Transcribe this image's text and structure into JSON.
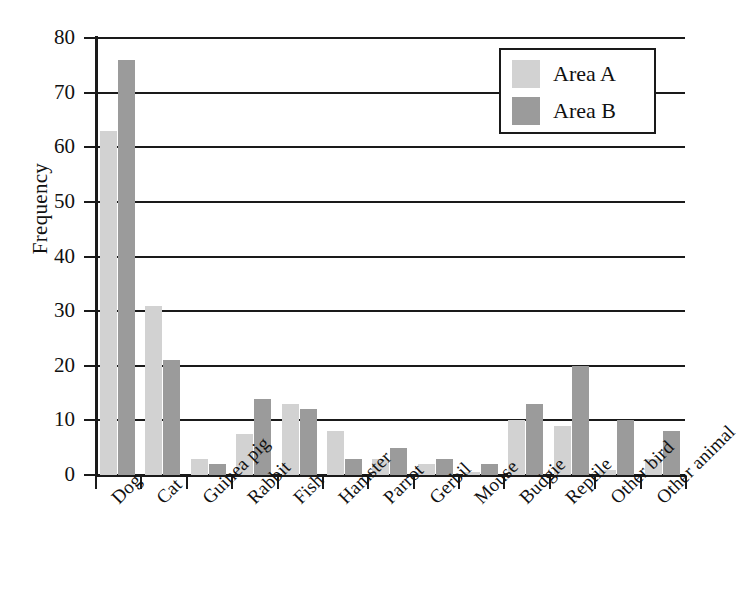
{
  "chart_data": {
    "type": "bar",
    "title": "",
    "xlabel": "",
    "ylabel": "Frequency",
    "ylim": [
      0,
      80
    ],
    "ytick_step": 10,
    "yticks": [
      0,
      10,
      20,
      30,
      40,
      50,
      60,
      70,
      80
    ],
    "grid": true,
    "legend_position": "top-right",
    "categories": [
      "Dog",
      "Cat",
      "Guinea pig",
      "Rabbit",
      "Fish",
      "Hamster",
      "Parrot",
      "Gerbil",
      "Mouse",
      "Budgie",
      "Reptile",
      "Other bird",
      "Other animal"
    ],
    "series": [
      {
        "name": "Area A",
        "color": "#d2d2d2",
        "values": [
          63,
          31,
          3,
          7.5,
          13,
          8,
          3,
          2,
          0.5,
          10,
          9,
          1,
          3
        ]
      },
      {
        "name": "Area B",
        "color": "#9b9b9b",
        "values": [
          76,
          21,
          2,
          14,
          12,
          3,
          5,
          3,
          2,
          13,
          20,
          10,
          8
        ]
      }
    ]
  },
  "legend": {
    "items": [
      {
        "label": "Area A"
      },
      {
        "label": "Area B"
      }
    ]
  },
  "colors": {
    "area_a": "#d2d2d2",
    "area_b": "#9b9b9b",
    "axis": "#1a1a1a",
    "background": "#ffffff"
  }
}
